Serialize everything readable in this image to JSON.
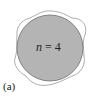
{
  "diagram": {
    "panel_label": "(a)",
    "mode_label": {
      "var": "n",
      "eq": " = ",
      "value": "4"
    },
    "colors": {
      "disk_fill": "#b4b4b4",
      "disk_stroke": "#6e6e6e",
      "wave_stroke": "#8a8a8a"
    }
  }
}
